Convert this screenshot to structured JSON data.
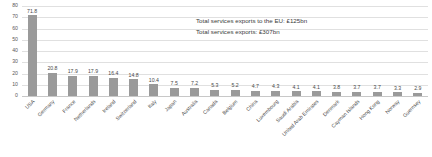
{
  "chart_data": {
    "type": "bar",
    "title": "",
    "xlabel": "",
    "ylabel": "",
    "ylim": [
      0,
      80
    ],
    "yticks": [
      0,
      10,
      20,
      30,
      40,
      50,
      60,
      70,
      80
    ],
    "grid": true,
    "legend": "none",
    "bar_color": "#9a9a9a",
    "categories": [
      "USA",
      "Germany",
      "France",
      "Netherlands",
      "Ireland",
      "Switzerland",
      "Italy",
      "Japan",
      "Australia",
      "Canada",
      "Belgium",
      "China",
      "Luxembourg",
      "Saudi Arabia",
      "United Arab Emirates",
      "Denmark",
      "Cayman Islands",
      "Hong Kong",
      "Norway",
      "Guernsey"
    ],
    "values": [
      71.8,
      20.8,
      17.9,
      17.9,
      16.4,
      14.8,
      10.4,
      7.5,
      7.2,
      5.3,
      5.2,
      4.7,
      4.3,
      4.1,
      4.1,
      3.8,
      3.7,
      3.7,
      3.3,
      2.9
    ],
    "value_labels": [
      "71.8",
      "20.8",
      "17.9",
      "17.9",
      "16.4",
      "14.8",
      "10.4",
      "7.5",
      "7.2",
      "5.3",
      "5.2",
      "4.7",
      "4.3",
      "4.1",
      "4.1",
      "3.8",
      "3.7",
      "3.7",
      "3.3",
      "2.9"
    ],
    "annotations": [
      "Total services exports to the EU: £125bn",
      "Total services exports: £307bn"
    ]
  }
}
